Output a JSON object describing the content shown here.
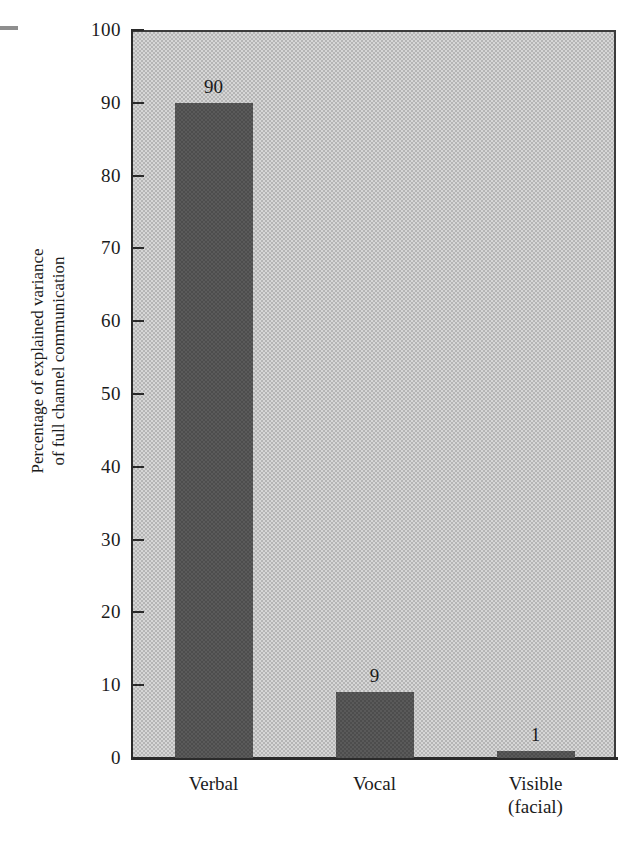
{
  "chart_data": {
    "type": "bar",
    "title": "",
    "subtitle": "",
    "xlabel": "",
    "ylabel_line1": "Percentage of explained variance",
    "ylabel_line2": "of full channel communication",
    "categories": [
      "Verbal",
      "Vocal",
      "Visible (facial)"
    ],
    "category_labels": [
      {
        "line1": "Verbal",
        "line2": ""
      },
      {
        "line1": "Vocal",
        "line2": ""
      },
      {
        "line1": "Visible",
        "line2": "(facial)"
      }
    ],
    "values": [
      90,
      9,
      1
    ],
    "value_labels": [
      "90",
      "9",
      "1"
    ],
    "ylim": [
      0,
      100
    ],
    "y_ticks": [
      0,
      10,
      20,
      30,
      40,
      50,
      60,
      70,
      80,
      90,
      100
    ],
    "y_tick_labels": [
      "0",
      "10",
      "20",
      "30",
      "40",
      "50",
      "60",
      "70",
      "80",
      "90",
      "100"
    ],
    "grid": false,
    "legend": "none",
    "colors": {
      "bar": "#4d4d4d",
      "plot_background": "#b5b5b5",
      "axis": "#2a2a2a",
      "page_background": "#ffffff",
      "text": "#1b1b1b"
    }
  }
}
